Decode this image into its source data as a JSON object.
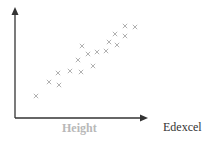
{
  "chart_data": {
    "type": "scatter",
    "title": "",
    "xlabel": "Height",
    "ylabel": "",
    "grid": false,
    "marker": "x",
    "points": [
      {
        "x": 36,
        "y": 96
      },
      {
        "x": 49,
        "y": 82
      },
      {
        "x": 59,
        "y": 85
      },
      {
        "x": 58,
        "y": 73
      },
      {
        "x": 70,
        "y": 71
      },
      {
        "x": 81,
        "y": 72
      },
      {
        "x": 78,
        "y": 60
      },
      {
        "x": 82,
        "y": 46
      },
      {
        "x": 88,
        "y": 54
      },
      {
        "x": 93,
        "y": 66
      },
      {
        "x": 97,
        "y": 52
      },
      {
        "x": 106,
        "y": 51
      },
      {
        "x": 109,
        "y": 42
      },
      {
        "x": 117,
        "y": 45
      },
      {
        "x": 115,
        "y": 34
      },
      {
        "x": 125,
        "y": 36
      },
      {
        "x": 125,
        "y": 26
      },
      {
        "x": 135,
        "y": 27
      }
    ],
    "trend": "strong positive correlation",
    "colors": {
      "axis": "#333333",
      "marker": "#a8a8a8",
      "xlabel": "#b8b8b8"
    }
  },
  "labels": {
    "xaxis": "Height",
    "brand": "Edexcel"
  }
}
